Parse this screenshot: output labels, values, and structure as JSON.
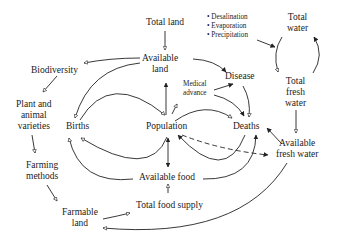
{
  "diagram": {
    "type": "causal-loop",
    "nodes": {
      "total_land": {
        "label": "Total land"
      },
      "available_land": {
        "label_1": "Available",
        "label_2": "land"
      },
      "biodiversity": {
        "label": "Biodiversity"
      },
      "plant_varieties": {
        "label_1": "Plant and",
        "label_2": "animal",
        "label_3": "varieties"
      },
      "farming_methods": {
        "label_1": "Farming",
        "label_2": "methods"
      },
      "farmable_land": {
        "label_1": "Farmable",
        "label_2": "land"
      },
      "births": {
        "label": "Births"
      },
      "population": {
        "label": "Population"
      },
      "deaths": {
        "label": "Deaths"
      },
      "disease": {
        "label": "Disease"
      },
      "medical_advance": {
        "label_1": "Medical",
        "label_2": "advance"
      },
      "available_food": {
        "label": "Available food"
      },
      "total_food_supply": {
        "label": "Total food supply"
      },
      "water_processes": {
        "item_1": "• Desalination",
        "item_2": "• Evaporation",
        "item_3": "• Precipitation"
      },
      "total_water": {
        "label_1": "Total",
        "label_2": "water"
      },
      "total_fresh_water": {
        "label_1": "Total",
        "label_2": "fresh",
        "label_3": "water"
      },
      "available_fresh_water": {
        "label_1": "Available",
        "label_2": "fresh water"
      }
    },
    "edges": [
      {
        "from": "Total land",
        "to": "Available land",
        "head": "hollow"
      },
      {
        "from": "Available land",
        "to": "Biodiversity",
        "head": "hollow"
      },
      {
        "from": "Available land",
        "to": "Births",
        "head": "hollow"
      },
      {
        "from": "Available land",
        "to": "Disease",
        "head": "solid"
      },
      {
        "from": "Population",
        "to": "Available land",
        "head": "solid"
      },
      {
        "from": "Births",
        "to": "Population",
        "head": "hollow"
      },
      {
        "from": "Population",
        "to": "Births",
        "head": "hollow"
      },
      {
        "from": "Available food",
        "to": "Births",
        "head": "hollow"
      },
      {
        "from": "Population",
        "to": "Medical advance",
        "head": "hollow"
      },
      {
        "from": "Medical advance",
        "to": "Disease",
        "head": "solid"
      },
      {
        "from": "Medical advance",
        "to": "Deaths",
        "head": "solid"
      },
      {
        "from": "Disease",
        "to": "Deaths",
        "head": "hollow"
      },
      {
        "from": "Population",
        "to": "Deaths",
        "head": "hollow"
      },
      {
        "from": "Deaths",
        "to": "Population",
        "head": "solid"
      },
      {
        "from": "Available food",
        "to": "Deaths",
        "head": "solid"
      },
      {
        "from": "Population",
        "to": "Available fresh water",
        "head": "solid",
        "style": "dashed"
      },
      {
        "from": "Population",
        "to": "Available food",
        "head": "solid",
        "bidirectional": true
      },
      {
        "from": "Total food supply",
        "to": "Available food",
        "head": "hollow"
      },
      {
        "from": "Biodiversity",
        "to": "Plant and animal varieties",
        "head": "hollow"
      },
      {
        "from": "Plant and animal varieties",
        "to": "Farming methods",
        "head": "hollow"
      },
      {
        "from": "Farming methods",
        "to": "Farmable land",
        "head": "hollow"
      },
      {
        "from": "Farmable land",
        "to": "Total food supply",
        "head": "hollow"
      },
      {
        "from": "Available fresh water",
        "to": "Farmable land",
        "head": "hollow"
      },
      {
        "from": "Available fresh water",
        "to": "Deaths",
        "head": "solid"
      },
      {
        "from": "Water processes",
        "to": "Total fresh water",
        "head": "solid"
      },
      {
        "from": "Total water",
        "to": "Total fresh water",
        "head": "hollow"
      },
      {
        "from": "Total fresh water",
        "to": "Total water",
        "head": "solid"
      },
      {
        "from": "Total fresh water",
        "to": "Available fresh water",
        "head": "hollow"
      }
    ]
  }
}
